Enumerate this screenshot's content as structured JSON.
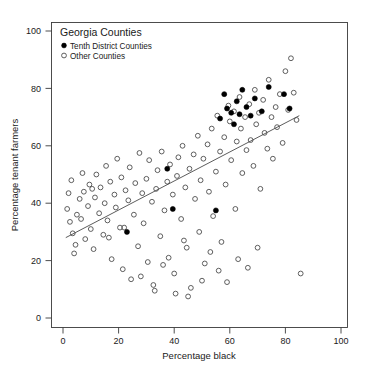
{
  "chart_data": {
    "type": "scatter",
    "title": "",
    "xlabel": "Percentage black",
    "ylabel": "Percentage tenant farmers",
    "xlim": [
      -3,
      107
    ],
    "ylim": [
      -4,
      104
    ],
    "xticks": [
      0,
      20,
      40,
      60,
      80,
      100
    ],
    "yticks": [
      0,
      20,
      40,
      60,
      80,
      100
    ],
    "xticklabels": [
      "0",
      "20",
      "40",
      "60",
      "80",
      "100"
    ],
    "yticklabels": [
      "0",
      "20",
      "40",
      "60",
      "80",
      "100"
    ],
    "grid": false,
    "legend": {
      "title": "Georgia Counties",
      "position": "top-left-inside",
      "entries": [
        {
          "label": "Tenth District Counties",
          "marker": "filled-circle",
          "color": "#000000"
        },
        {
          "label": "Other Counties",
          "marker": "open-circle",
          "color": "#4d4d4d"
        }
      ]
    },
    "annotations": [
      {
        "kind": "regression-line",
        "x": [
          1.0,
          85.0
        ],
        "y": [
          28.0,
          70.5
        ],
        "color": "#4a4a4a"
      }
    ],
    "series": [
      {
        "name": "Other Counties",
        "marker": "open-circle",
        "color": "#4d4d4d",
        "points": [
          [
            1.5,
            38.0
          ],
          [
            2.0,
            43.5
          ],
          [
            2.5,
            33.5
          ],
          [
            3.0,
            48.0
          ],
          [
            3.5,
            29.5
          ],
          [
            4.0,
            22.5
          ],
          [
            4.5,
            25.5
          ],
          [
            5.0,
            36.0
          ],
          [
            6.0,
            41.5
          ],
          [
            6.5,
            34.5
          ],
          [
            7.5,
            44.0
          ],
          [
            8.0,
            27.5
          ],
          [
            9.0,
            39.0
          ],
          [
            9.5,
            46.5
          ],
          [
            10.0,
            31.0
          ],
          [
            11.0,
            24.0
          ],
          [
            11.5,
            42.0
          ],
          [
            12.0,
            50.0
          ],
          [
            13.0,
            36.5
          ],
          [
            13.5,
            45.5
          ],
          [
            14.5,
            29.0
          ],
          [
            15.0,
            40.0
          ],
          [
            15.5,
            53.0
          ],
          [
            16.0,
            34.0
          ],
          [
            17.0,
            47.5
          ],
          [
            17.5,
            20.5
          ],
          [
            18.5,
            43.0
          ],
          [
            19.0,
            38.5
          ],
          [
            19.5,
            55.5
          ],
          [
            20.5,
            31.5
          ],
          [
            21.0,
            49.0
          ],
          [
            21.5,
            17.0
          ],
          [
            22.5,
            44.5
          ],
          [
            23.5,
            41.0
          ],
          [
            24.0,
            52.5
          ],
          [
            24.5,
            13.5
          ],
          [
            25.5,
            36.0
          ],
          [
            26.0,
            47.0
          ],
          [
            27.0,
            25.0
          ],
          [
            27.5,
            57.5
          ],
          [
            28.5,
            43.5
          ],
          [
            29.0,
            33.0
          ],
          [
            30.0,
            48.5
          ],
          [
            30.5,
            19.5
          ],
          [
            31.0,
            55.0
          ],
          [
            32.0,
            40.5
          ],
          [
            32.5,
            11.5
          ],
          [
            33.5,
            45.0
          ],
          [
            34.0,
            51.5
          ],
          [
            35.0,
            28.5
          ],
          [
            35.5,
            58.0
          ],
          [
            36.5,
            37.5
          ],
          [
            37.5,
            47.5
          ],
          [
            38.0,
            21.0
          ],
          [
            38.5,
            53.5
          ],
          [
            39.5,
            43.0
          ],
          [
            40.0,
            15.5
          ],
          [
            41.0,
            49.5
          ],
          [
            41.5,
            56.0
          ],
          [
            42.5,
            34.5
          ],
          [
            43.0,
            60.0
          ],
          [
            44.0,
            45.5
          ],
          [
            44.5,
            24.5
          ],
          [
            45.5,
            52.0
          ],
          [
            46.0,
            10.5
          ],
          [
            47.0,
            57.0
          ],
          [
            47.5,
            41.5
          ],
          [
            48.5,
            63.5
          ],
          [
            49.0,
            30.0
          ],
          [
            49.5,
            48.0
          ],
          [
            50.5,
            55.5
          ],
          [
            51.0,
            19.0
          ],
          [
            52.0,
            60.5
          ],
          [
            52.5,
            44.0
          ],
          [
            53.5,
            66.0
          ],
          [
            54.0,
            35.5
          ],
          [
            55.0,
            51.0
          ],
          [
            55.5,
            70.5
          ],
          [
            56.5,
            58.0
          ],
          [
            57.0,
            26.5
          ],
          [
            58.0,
            63.0
          ],
          [
            58.5,
            46.5
          ],
          [
            59.5,
            74.0
          ],
          [
            60.0,
            68.5
          ],
          [
            60.5,
            55.0
          ],
          [
            61.5,
            72.0
          ],
          [
            62.0,
            38.0
          ],
          [
            62.5,
            61.5
          ],
          [
            63.5,
            77.0
          ],
          [
            64.0,
            66.0
          ],
          [
            64.5,
            50.5
          ],
          [
            65.5,
            70.0
          ],
          [
            66.0,
            58.5
          ],
          [
            67.0,
            74.5
          ],
          [
            67.5,
            62.0
          ],
          [
            68.5,
            53.0
          ],
          [
            69.0,
            79.5
          ],
          [
            69.5,
            67.5
          ],
          [
            70.5,
            71.5
          ],
          [
            71.0,
            45.0
          ],
          [
            72.0,
            76.0
          ],
          [
            72.5,
            64.5
          ],
          [
            73.5,
            59.0
          ],
          [
            74.0,
            83.0
          ],
          [
            75.0,
            70.0
          ],
          [
            75.5,
            55.5
          ],
          [
            76.5,
            73.5
          ],
          [
            77.0,
            66.5
          ],
          [
            78.0,
            78.0
          ],
          [
            79.0,
            61.0
          ],
          [
            80.0,
            86.0
          ],
          [
            81.0,
            72.5
          ],
          [
            82.0,
            90.5
          ],
          [
            83.0,
            78.5
          ],
          [
            84.0,
            69.0
          ],
          [
            85.5,
            15.5
          ],
          [
            40.5,
            8.5
          ],
          [
            45.0,
            7.5
          ],
          [
            33.0,
            9.5
          ],
          [
            50.0,
            13.0
          ],
          [
            56.0,
            16.5
          ],
          [
            63.0,
            20.5
          ],
          [
            70.0,
            24.5
          ],
          [
            36.0,
            18.5
          ],
          [
            28.0,
            14.5
          ],
          [
            59.0,
            12.5
          ],
          [
            66.5,
            17.5
          ],
          [
            53.0,
            23.0
          ],
          [
            43.5,
            27.0
          ],
          [
            22.0,
            31.5
          ],
          [
            16.5,
            28.0
          ],
          [
            10.5,
            45.0
          ],
          [
            7.0,
            50.5
          ]
        ]
      },
      {
        "name": "Tenth District Counties",
        "marker": "filled-circle",
        "color": "#000000",
        "points": [
          [
            23.0,
            30.0
          ],
          [
            37.5,
            52.0
          ],
          [
            39.5,
            38.0
          ],
          [
            55.0,
            37.5
          ],
          [
            56.5,
            69.5
          ],
          [
            58.0,
            78.0
          ],
          [
            59.0,
            73.0
          ],
          [
            60.5,
            71.5
          ],
          [
            61.5,
            67.5
          ],
          [
            62.5,
            75.5
          ],
          [
            63.5,
            71.0
          ],
          [
            64.5,
            79.5
          ],
          [
            66.0,
            73.5
          ],
          [
            67.5,
            70.5
          ],
          [
            69.0,
            76.5
          ],
          [
            71.5,
            72.0
          ],
          [
            74.0,
            80.5
          ],
          [
            79.5,
            78.0
          ],
          [
            81.5,
            73.0
          ]
        ]
      }
    ]
  }
}
